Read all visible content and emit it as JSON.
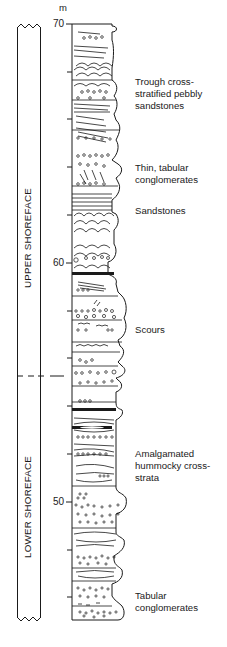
{
  "figure": {
    "unit_label": "m",
    "axis": {
      "ticks_labeled": [
        {
          "value": "70",
          "y": 24
        },
        {
          "value": "60",
          "y": 263
        },
        {
          "value": "50",
          "y": 502
        }
      ],
      "minor_tick_interval_m": 2,
      "range_m": [
        45,
        70
      ]
    },
    "zones": [
      {
        "label": "UPPER SHOREFACE",
        "from_m": 59.5,
        "to_m": 70
      },
      {
        "label": "LOWER SHOREFACE",
        "from_m": 45,
        "to_m": 59.5
      }
    ],
    "annotations": [
      {
        "text": "Trough cross-\nstratified pebbly\nsandstones",
        "y": 76
      },
      {
        "text": "Thin, tabular\nconglomerates",
        "y": 162
      },
      {
        "text": "Sandstones",
        "y": 205
      },
      {
        "text": "Scours",
        "y": 324
      },
      {
        "text": "Amalgamated\nhummocky cross-\nstrata",
        "y": 448
      },
      {
        "text": "Tabular\nconglomerates",
        "y": 590
      }
    ],
    "colors": {
      "ink": "#1a1a1a",
      "background": "#ffffff"
    }
  }
}
